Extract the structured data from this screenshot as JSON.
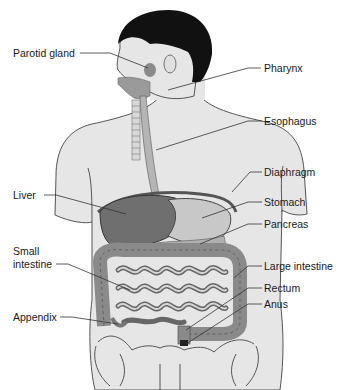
{
  "diagram": {
    "type": "anatomical-illustration",
    "colors": {
      "background": "#ffffff",
      "skin": "#e6e6e6",
      "hair": "#111111",
      "organ_dark": "#6f6f6f",
      "organ_mid": "#9a9a9a",
      "organ_light": "#c8c8c8",
      "leader_line": "#333333",
      "label_text": "#1a1a1a"
    },
    "labels_left": [
      {
        "id": "parotid-gland",
        "text": "Parotid gland"
      },
      {
        "id": "liver",
        "text": "Liver"
      },
      {
        "id": "small-intestine",
        "text": "Small\nintestine",
        "line1": "Small",
        "line2": "intestine"
      },
      {
        "id": "appendix",
        "text": "Appendix"
      }
    ],
    "labels_right": [
      {
        "id": "pharynx",
        "text": "Pharynx"
      },
      {
        "id": "esophagus",
        "text": "Esophagus"
      },
      {
        "id": "diaphragm",
        "text": "Diaphragm"
      },
      {
        "id": "stomach",
        "text": "Stomach"
      },
      {
        "id": "pancreas",
        "text": "Pancreas"
      },
      {
        "id": "large-intestine",
        "text": "Large intestine"
      },
      {
        "id": "rectum",
        "text": "Rectum"
      },
      {
        "id": "anus",
        "text": "Anus"
      }
    ]
  }
}
